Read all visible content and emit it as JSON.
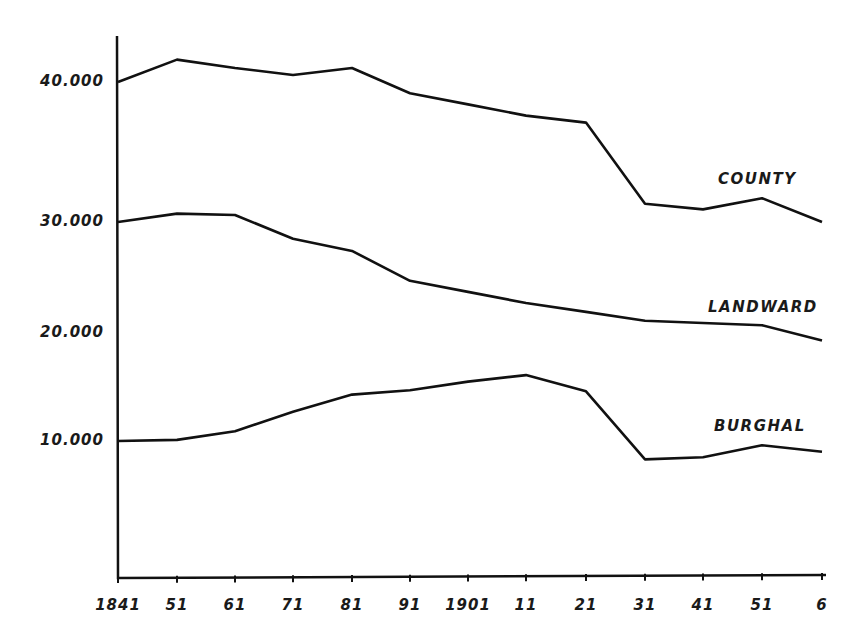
{
  "chart_data": {
    "type": "line",
    "title": "",
    "xlabel": "",
    "ylabel": "",
    "categories": [
      "1841",
      "51",
      "61",
      "71",
      "81",
      "91",
      "1901",
      "11",
      "21",
      "31",
      "41",
      "51",
      "6"
    ],
    "x_years": [
      1841,
      1851,
      1861,
      1871,
      1881,
      1891,
      1901,
      1911,
      1921,
      1931,
      1941,
      1951,
      1961
    ],
    "y_ticks": [
      {
        "value": 40000,
        "label": "40.000"
      },
      {
        "value": 30000,
        "label": "30.000"
      },
      {
        "value": 20000,
        "label": "20.000"
      },
      {
        "value": 10000,
        "label": "10.000"
      }
    ],
    "ylim": [
      0,
      44000
    ],
    "grid": false,
    "legend_position": "inline labels at right end of lines",
    "series": [
      {
        "name": "COUNTY",
        "values": [
          40000,
          41600,
          41000,
          40500,
          41000,
          39200,
          38400,
          37600,
          37100,
          31300,
          30900,
          31700,
          30000
        ]
      },
      {
        "name": "LANDWARD",
        "values": [
          30000,
          30600,
          30500,
          28500,
          27400,
          24700,
          23700,
          22700,
          21900,
          21100,
          20900,
          20700,
          19300
        ]
      },
      {
        "name": "BURGHAL",
        "values": [
          10000,
          10100,
          10900,
          12700,
          14300,
          14700,
          15500,
          16100,
          14600,
          8300,
          8500,
          9600,
          9000
        ]
      }
    ]
  },
  "labels": {
    "county": "COUNTY",
    "landward": "LANDWARD",
    "burghal": "BURGHAL"
  },
  "colors": {
    "line": "#111111",
    "background": "#ffffff"
  }
}
